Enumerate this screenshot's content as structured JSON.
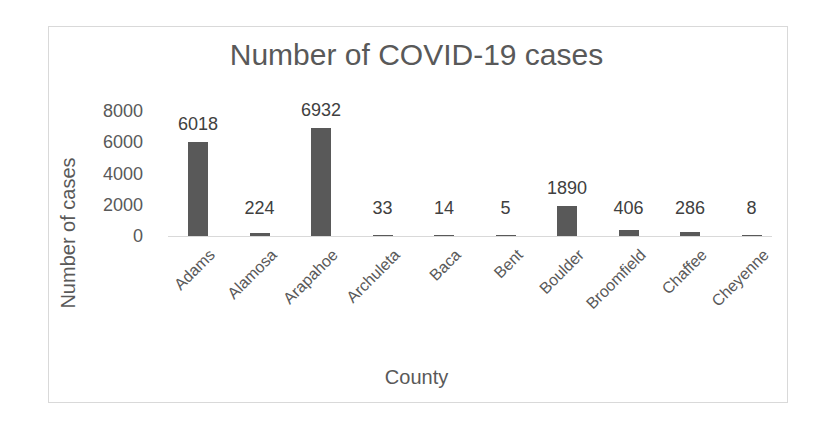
{
  "chart_data": {
    "type": "bar",
    "title": "Number of COVID-19 cases",
    "xlabel": "County",
    "ylabel": "Number of cases",
    "categories": [
      "Adams",
      "Alamosa",
      "Arapahoe",
      "Archuleta",
      "Baca",
      "Bent",
      "Boulder",
      "Broomfield",
      "Chaffee",
      "Cheyenne"
    ],
    "values": [
      6018,
      224,
      6932,
      33,
      14,
      5,
      1890,
      406,
      286,
      8
    ],
    "data_labels": [
      "6018",
      "224",
      "6932",
      "33",
      "14",
      "5",
      "1890",
      "406",
      "286",
      "8"
    ],
    "yticks": [
      "0",
      "2000",
      "4000",
      "6000",
      "8000"
    ],
    "ylim": [
      0,
      8000
    ],
    "grid": false,
    "legend": "none",
    "bar_color": "#595959"
  }
}
